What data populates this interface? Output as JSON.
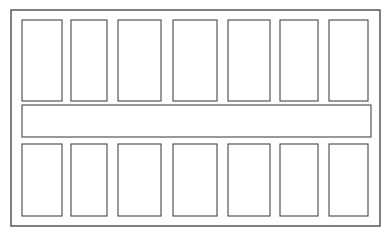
{
  "figure": {
    "kind": "schematic-floor-plan-diagram",
    "background_color": "#ffffff",
    "line_color": "#454545",
    "frame_line_color": "#3c3c3c",
    "canvas": {
      "width": 391,
      "height": 242
    },
    "outer_frame": {
      "x": 11,
      "y": 10,
      "width": 369,
      "height": 216
    },
    "top_row": {
      "label": "top-row-cells",
      "y": 20,
      "height": 81,
      "cells": [
        {
          "name": "top-cell-1",
          "x": 22,
          "width": 40
        },
        {
          "name": "top-cell-2",
          "x": 71,
          "width": 36
        },
        {
          "name": "top-cell-3",
          "x": 118,
          "width": 43
        },
        {
          "name": "top-cell-4",
          "x": 173,
          "width": 44
        },
        {
          "name": "top-cell-5",
          "x": 228,
          "width": 42
        },
        {
          "name": "top-cell-6",
          "x": 280,
          "width": 38
        },
        {
          "name": "top-cell-7",
          "x": 329,
          "width": 39
        }
      ]
    },
    "middle_band": {
      "name": "horizontal-corridor",
      "x": 22,
      "y": 105,
      "width": 349,
      "height": 32
    },
    "bottom_row": {
      "label": "bottom-row-cells",
      "y": 144,
      "height": 72,
      "cells": [
        {
          "name": "bottom-cell-1",
          "x": 22,
          "width": 40
        },
        {
          "name": "bottom-cell-2",
          "x": 71,
          "width": 36
        },
        {
          "name": "bottom-cell-3",
          "x": 118,
          "width": 43
        },
        {
          "name": "bottom-cell-4",
          "x": 173,
          "width": 44
        },
        {
          "name": "bottom-cell-5",
          "x": 228,
          "width": 42
        },
        {
          "name": "bottom-cell-6",
          "x": 280,
          "width": 38
        },
        {
          "name": "bottom-cell-7",
          "x": 329,
          "width": 39
        }
      ]
    },
    "center_column": {
      "name": "vertical-corridor",
      "x": 173,
      "width": 44,
      "note": "center column is open between top row and bottom row, forming the cross"
    }
  }
}
